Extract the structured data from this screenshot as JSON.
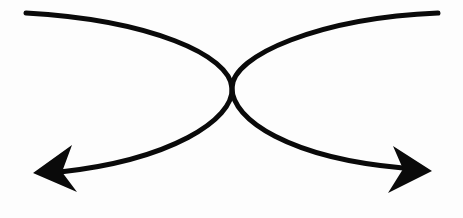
{
  "diagram": {
    "title": "",
    "background": "#fdfdfd",
    "stroke_color": "#0a0a0a",
    "stroke_width": 5,
    "elements": [
      {
        "id": "left-arrow",
        "type": "curved-arrow",
        "path": "M26,13 C150,20 230,55 232,88 C234,120 170,160 60,172",
        "head": {
          "tip": [
            33,
            173
          ],
          "base_top": [
            72,
            145
          ],
          "base_bottom": [
            77,
            192
          ],
          "notch": [
            62,
            172
          ]
        }
      },
      {
        "id": "right-arrow",
        "type": "curved-arrow",
        "path": "M438,13 C320,18 232,55 232,88 C232,120 290,158 403,168",
        "head": {
          "tip": [
            432,
            171
          ],
          "base_top": [
            393,
            146
          ],
          "base_bottom": [
            388,
            193
          ],
          "notch": [
            403,
            169
          ]
        }
      }
    ]
  }
}
